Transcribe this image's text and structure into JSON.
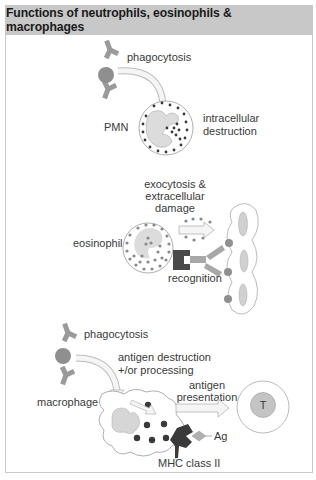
{
  "title": "Functions of neutrophils, eosinophils & macrophages",
  "panels": {
    "neutrophil": {
      "labels": {
        "phagocytosis": "phagocytosis",
        "cell": "PMN",
        "outcome_line1": "intracellular",
        "outcome_line2": "destruction"
      }
    },
    "eosinophil": {
      "labels": {
        "exocytosis_line1": "exocytosis &",
        "exocytosis_line2": "extracellular",
        "exocytosis_line3": "damage",
        "cell": "eosinophil",
        "recognition": "recognition"
      }
    },
    "macrophage": {
      "labels": {
        "phagocytosis": "phagocytosis",
        "processing_line1": "antigen destruction",
        "processing_line2": "+/or processing",
        "presentation_line1": "antigen",
        "presentation_line2": "presentation",
        "cell": "macrophage",
        "antigen": "Ag",
        "mhc": "MHC class II",
        "tcell": "T"
      }
    }
  },
  "colors": {
    "header_bg": "#c8c8c8",
    "cell_fill": "#e6e6e6",
    "granule_dark": "#3a3a3a",
    "granule_mid": "#8a8a8a",
    "antibody": "#9a9a9a",
    "receptor_dark": "#4a4a4a"
  }
}
